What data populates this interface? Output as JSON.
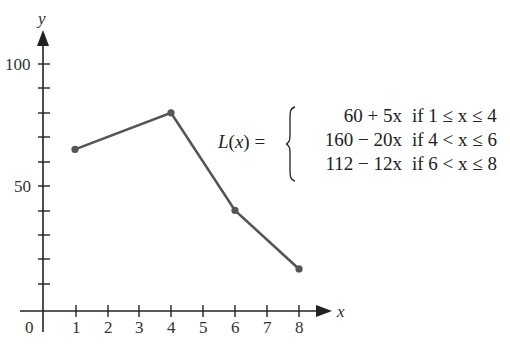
{
  "chart_data": {
    "type": "line",
    "title": "",
    "xlabel": "x",
    "ylabel": "y",
    "x": [
      1,
      4,
      6,
      8
    ],
    "series": [
      {
        "name": "L(x)",
        "values": [
          65,
          80,
          40,
          16
        ]
      }
    ],
    "xlim": [
      0,
      8
    ],
    "ylim": [
      0,
      100
    ],
    "x_ticks": [
      "0",
      "1",
      "2",
      "3",
      "4",
      "5",
      "6",
      "7",
      "8"
    ],
    "y_tick_labels": [
      "50",
      "100"
    ],
    "y_minor_tick_step": 10,
    "grid": false,
    "markers": true,
    "annotation": {
      "lhs": "L(x) =",
      "cases": [
        {
          "expr": "60 + 5x",
          "cond": "if 1 ≤ x ≤ 4"
        },
        {
          "expr": "160 − 20x",
          "cond": "if 4 < x ≤ 6"
        },
        {
          "expr": "112 − 12x",
          "cond": "if 6 < x ≤ 8"
        }
      ]
    },
    "colors": {
      "line": "#555555",
      "axis": "#222222"
    }
  },
  "axes": {
    "x_label": "x",
    "y_label": "y",
    "origin_label": "0",
    "x_tick_labels": [
      "1",
      "2",
      "3",
      "4",
      "5",
      "6",
      "7",
      "8"
    ],
    "y_tick_label_50": "50",
    "y_tick_label_100": "100"
  },
  "formula": {
    "lhs": "L(x) =",
    "case1_expr": "60 + 5x",
    "case1_cond": "if 1 ≤ x ≤ 4",
    "case2_expr": "160 − 20x",
    "case2_cond": "if 4 < x ≤ 6",
    "case3_expr": "112 − 12x",
    "case3_cond": "if 6 < x ≤ 8"
  }
}
